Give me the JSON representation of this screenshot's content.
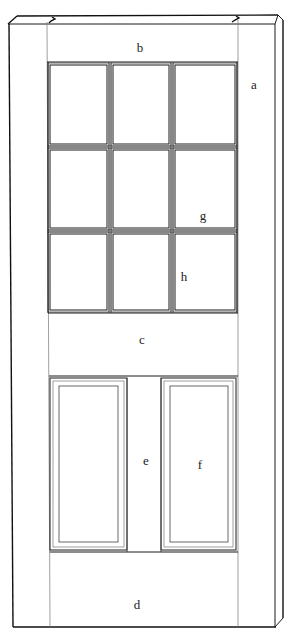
{
  "diagram": {
    "colors": {
      "background": "#ffffff",
      "line": "#1a1a1a"
    },
    "labels": [
      {
        "id": "a",
        "text": "a",
        "x": 254,
        "y": 84
      },
      {
        "id": "b",
        "text": "b",
        "x": 140,
        "y": 47
      },
      {
        "id": "c",
        "text": "c",
        "x": 142,
        "y": 339
      },
      {
        "id": "d",
        "text": "d",
        "x": 137,
        "y": 604
      },
      {
        "id": "e",
        "text": "e",
        "x": 146,
        "y": 460
      },
      {
        "id": "f",
        "text": "f",
        "x": 200,
        "y": 464
      },
      {
        "id": "g",
        "text": "g",
        "x": 203,
        "y": 215
      },
      {
        "id": "h",
        "text": "h",
        "x": 184,
        "y": 276
      }
    ],
    "geometry": {
      "door_face": {
        "x1": 13,
        "x2": 275,
        "y1": 24,
        "y2": 627
      },
      "side_face_right_x": 283,
      "top_edge": {
        "left_back": [
          17,
          16
        ],
        "right_back": [
          278,
          15
        ]
      },
      "stile_inner": {
        "left": 47,
        "right": 238
      },
      "top_rail_bottom": 62,
      "glass_grid": {
        "columns": [
          [
            49,
            108
          ],
          [
            112,
            170
          ],
          [
            174,
            236
          ]
        ],
        "rows": [
          [
            64,
            145
          ],
          [
            149,
            229
          ],
          [
            233,
            311
          ]
        ]
      },
      "middle_rail": {
        "top": 313,
        "bottom": 376
      },
      "lower_panels": [
        {
          "frame": [
            50,
            378,
            127,
            550
          ],
          "inner": [
            59,
            386,
            118,
            542
          ]
        },
        {
          "frame": [
            161,
            378,
            236,
            550
          ],
          "inner": [
            170,
            386,
            228,
            542
          ]
        }
      ],
      "bottom_rail": {
        "top": 552,
        "bottom": 627
      }
    }
  }
}
